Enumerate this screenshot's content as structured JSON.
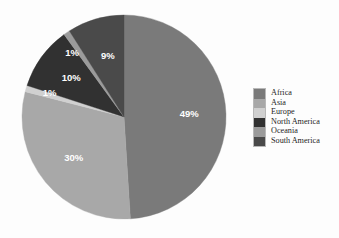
{
  "chart_data": {
    "type": "pie",
    "title": "",
    "categories": [
      "Africa",
      "Asia",
      "Europe",
      "North America",
      "Oceania",
      "South America"
    ],
    "values": [
      49,
      30,
      1,
      10,
      1,
      9
    ],
    "value_labels": [
      "49%",
      "30%",
      "1%",
      "10%",
      "1%",
      "9%"
    ],
    "unit": "%",
    "colors": [
      "#7a7a7a",
      "#a8a8a8",
      "#d0d0d0",
      "#313131",
      "#9b9b9b",
      "#4a4a4a"
    ],
    "legend": {
      "position": "right",
      "entries": [
        {
          "label": "Africa",
          "color": "#7a7a7a",
          "value_label": "49%"
        },
        {
          "label": "Asia",
          "color": "#a8a8a8",
          "value_label": "30%"
        },
        {
          "label": "Europe",
          "color": "#d0d0d0",
          "value_label": "1%"
        },
        {
          "label": "North America",
          "color": "#313131",
          "value_label": "10%"
        },
        {
          "label": "Oceania",
          "color": "#9b9b9b",
          "value_label": "1%"
        },
        {
          "label": "South America",
          "color": "#4a4a4a",
          "value_label": "9%"
        }
      ]
    },
    "start_angle_deg": 0,
    "direction": "clockwise",
    "label_color": "#ffffff",
    "background": "#fdfdfd",
    "grid": false
  },
  "figure": {
    "center_x": 124,
    "center_y": 117,
    "radius": 102
  }
}
